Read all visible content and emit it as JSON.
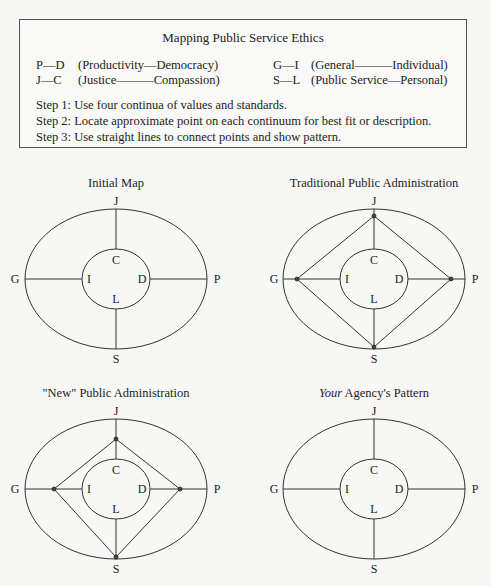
{
  "legend": {
    "title": "Mapping Public Service Ethics",
    "pairs": [
      {
        "code": "P—D",
        "desc": "(Productivity—Democracy)"
      },
      {
        "code": "J—C",
        "desc": "(Justice———Compassion)"
      },
      {
        "code": "G—I",
        "desc": "(General———Individual)"
      },
      {
        "code": "S—L",
        "desc": "(Public Service—Personal)"
      }
    ],
    "steps": [
      "Step 1: Use four continua of values and standards.",
      "Step 2: Locate approximate point on each continuum for best fit or description.",
      "Step 3: Use straight lines to connect points and show pattern."
    ]
  },
  "maps": [
    {
      "title": "Initial Map",
      "title_italic_prefix": "",
      "pattern": null
    },
    {
      "title": "Traditional Public Administration",
      "title_italic_prefix": "",
      "pattern": "outer-diamond"
    },
    {
      "title": "\"New\" Public Administration",
      "title_italic_prefix": "",
      "pattern": "inner-diamond"
    },
    {
      "title": " Agency's Pattern",
      "title_italic_prefix": "Your",
      "pattern": null
    }
  ],
  "axis_labels": {
    "top": "J",
    "bottom": "S",
    "left": "G",
    "right": "P",
    "inner_top": "C",
    "inner_bottom": "L",
    "inner_left": "I",
    "inner_right": "D"
  }
}
